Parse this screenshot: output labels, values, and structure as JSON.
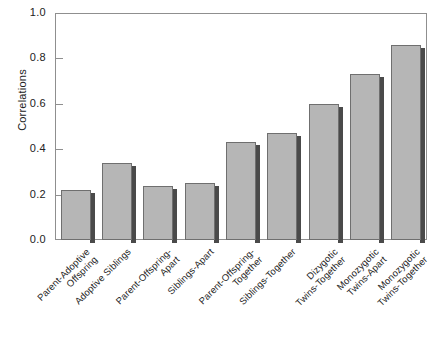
{
  "chart_data": {
    "type": "bar",
    "title": "",
    "xlabel": "",
    "ylabel": "Correlations",
    "ylim": [
      0.0,
      1.0
    ],
    "yticks": [
      "0.0",
      "0.2",
      "0.4",
      "0.6",
      "0.8",
      "1.0"
    ],
    "ytick_values": [
      0.0,
      0.2,
      0.4,
      0.6,
      0.8,
      1.0
    ],
    "grid": false,
    "legend": "none",
    "categories": [
      "Parent-Adoptive\nOffspring",
      "Adoptive Siblings",
      "Parent-Offspring-\nApart",
      "Siblings-Apart",
      "Parent-Offspring-\nTogether",
      "Siblings-Together",
      "Dizygotic\nTwins-Together",
      "Monozygotic\nTwins-Apart",
      "Monozygotic\nTwins-Together"
    ],
    "values": [
      0.22,
      0.34,
      0.24,
      0.25,
      0.43,
      0.47,
      0.6,
      0.73,
      0.86
    ],
    "bar_color": "#b6b6b6",
    "bar_edge_color": "#6f6f6f",
    "bar_shadow_color": "#4a4a4a",
    "axis_color": "#8f8f8f",
    "background": "#ffffff"
  }
}
